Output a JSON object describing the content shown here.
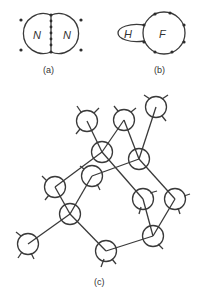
{
  "diagram_a": {
    "caption": "(a)",
    "left_label": "N",
    "right_label": "N"
  },
  "diagram_b": {
    "caption": "(b)",
    "small_label": "H",
    "large_label": "F"
  },
  "diagram_c": {
    "caption": "(c)",
    "nodes": [
      {
        "id": "A",
        "x": 87,
        "y": 121
      },
      {
        "id": "B",
        "x": 124,
        "y": 120
      },
      {
        "id": "C",
        "x": 156,
        "y": 107
      },
      {
        "id": "D",
        "x": 102,
        "y": 152
      },
      {
        "id": "E",
        "x": 139,
        "y": 159
      },
      {
        "id": "F",
        "x": 92,
        "y": 176
      },
      {
        "id": "G",
        "x": 55,
        "y": 187
      },
      {
        "id": "H",
        "x": 143,
        "y": 199
      },
      {
        "id": "I",
        "x": 175,
        "y": 199
      },
      {
        "id": "J",
        "x": 70,
        "y": 214
      },
      {
        "id": "K",
        "x": 28,
        "y": 244
      },
      {
        "id": "L",
        "x": 106,
        "y": 251
      },
      {
        "id": "M",
        "x": 153,
        "y": 236
      }
    ]
  },
  "colors": {
    "line": "#3a3a3a",
    "background": "#ffffff"
  }
}
